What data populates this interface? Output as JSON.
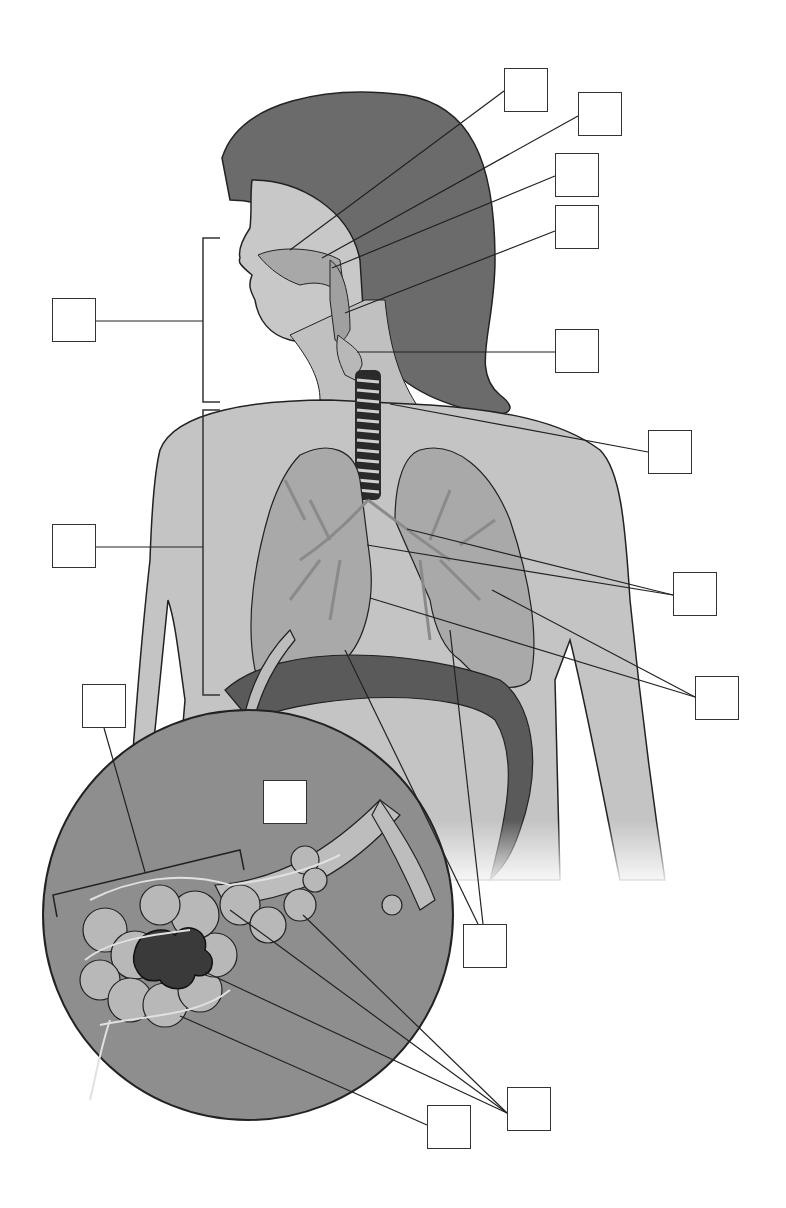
{
  "diagram": {
    "title": "",
    "colors": {
      "hair": "#6b6b6b",
      "skin": "#c4c4c4",
      "lung": "#a9a9a9",
      "diaphragm": "#5a5a5a",
      "inset": "#8e8e8e",
      "line": "#222222"
    },
    "label_boxes": [
      {
        "id": "box-nasal-cavity",
        "text": "",
        "x": 504,
        "y": 68
      },
      {
        "id": "box-nostril",
        "text": "",
        "x": 578,
        "y": 92
      },
      {
        "id": "box-pharynx-upper",
        "text": "",
        "x": 555,
        "y": 153
      },
      {
        "id": "box-pharynx",
        "text": "",
        "x": 555,
        "y": 205
      },
      {
        "id": "box-upper-tract-group",
        "text": "",
        "x": 52,
        "y": 298
      },
      {
        "id": "box-larynx",
        "text": "",
        "x": 555,
        "y": 329
      },
      {
        "id": "box-trachea",
        "text": "",
        "x": 648,
        "y": 430
      },
      {
        "id": "box-lower-tract-group",
        "text": "",
        "x": 52,
        "y": 524
      },
      {
        "id": "box-bronchi",
        "text": "",
        "x": 673,
        "y": 572
      },
      {
        "id": "box-lungs",
        "text": "",
        "x": 695,
        "y": 676
      },
      {
        "id": "box-alveolar-sac-group",
        "text": "",
        "x": 82,
        "y": 684
      },
      {
        "id": "box-inset-title",
        "text": "",
        "x": 263,
        "y": 780
      },
      {
        "id": "box-bronchioles",
        "text": "",
        "x": 463,
        "y": 924
      },
      {
        "id": "box-capillaries",
        "text": "",
        "x": 427,
        "y": 1105
      },
      {
        "id": "box-alveoli",
        "text": "",
        "x": 507,
        "y": 1087
      }
    ]
  }
}
